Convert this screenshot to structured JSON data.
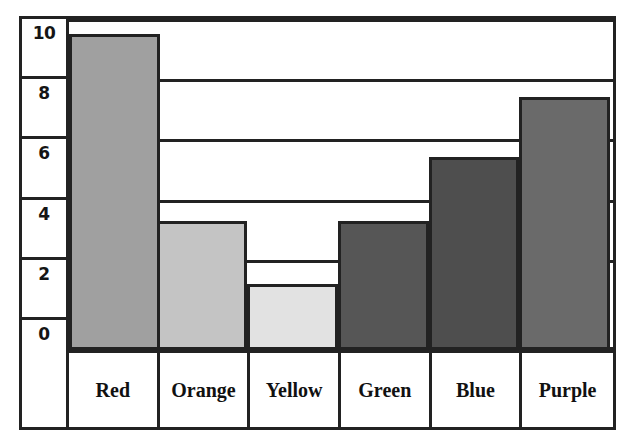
{
  "chart_data": {
    "type": "bar",
    "title": "",
    "xlabel": "",
    "ylabel": "",
    "categories": [
      "Red",
      "Orange",
      "Yellow",
      "Green",
      "Blue",
      "Purple"
    ],
    "values": [
      10.5,
      4.3,
      2.2,
      4.3,
      6.4,
      8.4
    ],
    "ylim": [
      0,
      12
    ],
    "ytick_labels": [
      "10",
      "8",
      "6",
      "4",
      "2",
      "0"
    ],
    "ytick_values": [
      10,
      8,
      6,
      4,
      2,
      0
    ],
    "grid": true,
    "legend": "none",
    "bar_colors": [
      "#a0a0a0",
      "#c4c4c4",
      "#e2e2e2",
      "#565656",
      "#4e4e4e",
      "#6a6a6a"
    ],
    "bar_border_color": "#222222",
    "background_color": "#ffffff"
  },
  "axis": {
    "ticks": [
      {
        "label": "10",
        "value": 10
      },
      {
        "label": "8",
        "value": 8
      },
      {
        "label": "6",
        "value": 6
      },
      {
        "label": "4",
        "value": 4
      },
      {
        "label": "2",
        "value": 2
      },
      {
        "label": "0",
        "value": 0
      }
    ]
  },
  "bars": [
    {
      "label": "Red",
      "value": 10.5,
      "color": "#a0a0a0"
    },
    {
      "label": "Orange",
      "value": 4.3,
      "color": "#c4c4c4"
    },
    {
      "label": "Yellow",
      "value": 2.2,
      "color": "#e2e2e2"
    },
    {
      "label": "Green",
      "value": 4.3,
      "color": "#565656"
    },
    {
      "label": "Blue",
      "value": 6.4,
      "color": "#4e4e4e"
    },
    {
      "label": "Purple",
      "value": 8.4,
      "color": "#6a6a6a"
    }
  ]
}
